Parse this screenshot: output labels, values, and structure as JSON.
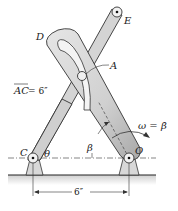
{
  "figure": {
    "type": "mechanism diagram"
  },
  "labels": {
    "D": "D",
    "E": "E",
    "A": "A",
    "C": "C",
    "O": "O",
    "theta": "θ",
    "beta": "β",
    "ac_length": "AC = 6″",
    "ac_bar": "AC",
    "ac_value": " = 6″",
    "omega": "ω = β̇",
    "base_dimension": "6″"
  },
  "colors": {
    "link_fill": "#d4d4d4",
    "link_stroke": "#333333",
    "arm_fill": "#dcdcdc",
    "arm_shade": "#b8b8b8",
    "ground_fill": "#e6e6e6",
    "line": "#222222"
  }
}
